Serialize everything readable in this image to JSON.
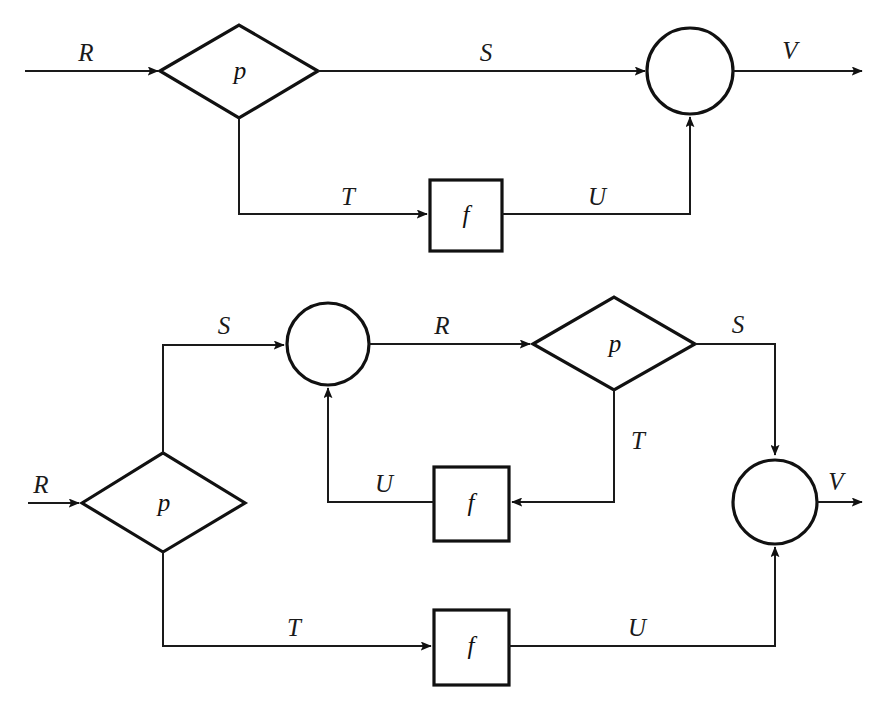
{
  "figure": {
    "background_color": "#ffffff",
    "line_color": "#1a1a1a",
    "node_stroke_color": "#111111"
  },
  "diagrams": [
    {
      "id": "top-diagram",
      "name": "single-stage-flow",
      "nodes": [
        {
          "id": "top-diamond-p",
          "shape": "diamond",
          "label": "p"
        },
        {
          "id": "top-box-f",
          "shape": "rect",
          "label": "f"
        },
        {
          "id": "top-circle-merge",
          "shape": "circle",
          "label": ""
        }
      ],
      "edge_labels": [
        {
          "id": "top-label-R",
          "text": "R"
        },
        {
          "id": "top-label-S",
          "text": "S"
        },
        {
          "id": "top-label-T",
          "text": "T"
        },
        {
          "id": "top-label-U",
          "text": "U"
        },
        {
          "id": "top-label-V",
          "text": "V"
        }
      ]
    },
    {
      "id": "bottom-diagram",
      "name": "two-stage-unfolded-flow",
      "nodes": [
        {
          "id": "bottom-diamond-p-1",
          "shape": "diamond",
          "label": "p"
        },
        {
          "id": "bottom-circle-merge-1",
          "shape": "circle",
          "label": ""
        },
        {
          "id": "bottom-diamond-p-2",
          "shape": "diamond",
          "label": "p"
        },
        {
          "id": "bottom-box-f-mid",
          "shape": "rect",
          "label": "f"
        },
        {
          "id": "bottom-box-f-low",
          "shape": "rect",
          "label": "f"
        },
        {
          "id": "bottom-circle-merge-2",
          "shape": "circle",
          "label": ""
        }
      ],
      "edge_labels": [
        {
          "id": "bottom-label-R-in",
          "text": "R"
        },
        {
          "id": "bottom-label-S-up",
          "text": "S"
        },
        {
          "id": "bottom-label-R-mid",
          "text": "R"
        },
        {
          "id": "bottom-label-S-right",
          "text": "S"
        },
        {
          "id": "bottom-label-T-mid",
          "text": "T"
        },
        {
          "id": "bottom-label-U-mid",
          "text": "U"
        },
        {
          "id": "bottom-label-T-low",
          "text": "T"
        },
        {
          "id": "bottom-label-U-low",
          "text": "U"
        },
        {
          "id": "bottom-label-V-out",
          "text": "V"
        }
      ]
    }
  ],
  "labels": {
    "top": {
      "R": "R",
      "S": "S",
      "T": "T",
      "U": "U",
      "V": "V",
      "p": "p",
      "f": "f"
    },
    "bottom": {
      "R_in": "R",
      "S_up": "S",
      "R_mid": "R",
      "S_right": "S",
      "T_mid": "T",
      "U_mid": "U",
      "T_low": "T",
      "U_low": "U",
      "V_out": "V",
      "p1": "p",
      "p2": "p",
      "f_mid": "f",
      "f_low": "f"
    }
  }
}
